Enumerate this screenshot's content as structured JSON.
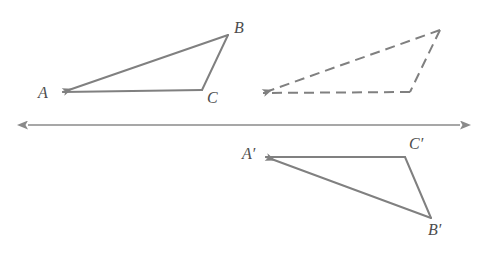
{
  "figure": {
    "background_color": "#ffffff",
    "stroke_color": "#808080",
    "label_color": "#4d4d4d",
    "stroke_width": 2,
    "dash_pattern": "10 6"
  },
  "axis": {
    "name": "line-of-reflection",
    "style": "double-headed-arrow",
    "x1": 28,
    "y1": 125,
    "x2": 460,
    "y2": 125,
    "color": "#8a8a8a",
    "stroke_width": 1.3
  },
  "shapes": {
    "triangle_original": {
      "name": "triangle-ABC",
      "style": "solid",
      "vertices": [
        {
          "label": "A",
          "x": 63,
          "y": 92,
          "label_x": 38,
          "label_y": 85
        },
        {
          "label": "B",
          "x": 228,
          "y": 35,
          "label_x": 234,
          "label_y": 20
        },
        {
          "label": "C",
          "x": 202,
          "y": 90,
          "label_x": 207,
          "label_y": 90
        }
      ]
    },
    "triangle_dashed": {
      "name": "triangle-dashed-translated",
      "style": "dashed",
      "vertices": [
        {
          "x": 263,
          "y": 93
        },
        {
          "x": 440,
          "y": 30
        },
        {
          "x": 410,
          "y": 92
        }
      ]
    },
    "triangle_image": {
      "name": "triangle-A-prime-B-prime-C-prime",
      "style": "solid",
      "vertices": [
        {
          "label": "A′",
          "x": 266,
          "y": 157,
          "label_x": 242,
          "label_y": 146
        },
        {
          "label": "B′",
          "x": 431,
          "y": 218,
          "label_x": 428,
          "label_y": 222
        },
        {
          "label": "C′",
          "x": 405,
          "y": 157,
          "label_x": 409,
          "label_y": 136
        }
      ]
    }
  },
  "labels": {
    "A": "A",
    "B": "B",
    "C": "C",
    "A_prime": "A′",
    "B_prime": "B′",
    "C_prime": "C′"
  }
}
